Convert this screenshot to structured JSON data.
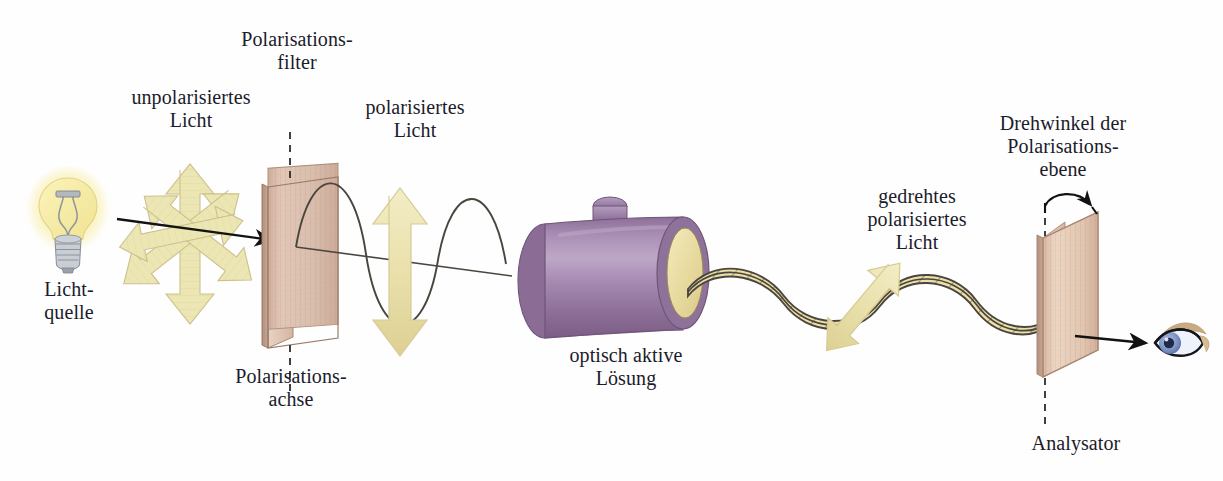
{
  "figure": {
    "language": "de",
    "background_color": "#fefefe",
    "text_color": "#1b1b2b"
  },
  "labels": {
    "light_source": "Licht-\nquelle",
    "unpolarized_light": "unpolarisiertes\nLicht",
    "polarization_filter": "Polarisations-\nfilter",
    "polarization_axis": "Polarisations-\nachse",
    "polarized_light": "polarisiertes\nLicht",
    "optically_active_solution": "optisch aktive\nLösung",
    "rotated_polarized_light": "gedrehtes\npolarisiertes\nLicht",
    "rotation_angle": "Drehwinkel der\nPolarisations-\nebene",
    "analyzer": "Analysator"
  },
  "components": [
    {
      "name": "light-bulb",
      "label": "Licht-\nquelle",
      "color_glass": "#f2e9a8",
      "color_glow": "#f7e98a",
      "color_base": "#9aa0a8"
    },
    {
      "name": "unpolarized-arrow-burst",
      "label": "unpolarisiertes\nLicht",
      "color": "#efe6b4",
      "arrow_count": 4,
      "arrow_angles_deg": [
        0,
        45,
        90,
        135
      ],
      "meaning": "Schwingung in allen Ebenen"
    },
    {
      "name": "polarization-filter-plate",
      "label": "Polarisations-\nfilter",
      "color_face": "#dcc0b0",
      "color_edge": "#c6a391",
      "axis_label": "Polarisations-\nachse",
      "axis_orientation": "vertikal"
    },
    {
      "name": "polarized-wave",
      "label": "polarisiertes\nLicht",
      "color_fill": "#ece1a8",
      "color_stroke": "#4a463f",
      "hatching": "vertikal",
      "amplitude_px": 62,
      "cycles": 2,
      "oscillation_angle_deg": 0
    },
    {
      "name": "polarized-double-arrow",
      "color": "#ece6b4",
      "angle_deg": 0,
      "meaning": "Schwingungsebene senkrecht"
    },
    {
      "name": "sample-tube",
      "label": "optisch aktive\nLösung",
      "color_body": "#9b7ba5",
      "color_body_light": "#b49bbd",
      "color_body_dark": "#7c6086",
      "color_end_face": "#ece0a6",
      "has_stopper": true
    },
    {
      "name": "rotated-wave",
      "label": "gedrehtes\npolarisiertes\nLicht",
      "color_fill": "#ece1a8",
      "color_stroke": "#4a463f",
      "hatching": "diagonal",
      "amplitude_px": 26,
      "cycles": 3,
      "oscillation_angle_deg": 40
    },
    {
      "name": "rotated-double-arrow",
      "color": "#ece6b4",
      "angle_deg": 40,
      "meaning": "gedrehte Schwingungsebene"
    },
    {
      "name": "analyzer-plate",
      "label": "Analysator",
      "color_face": "#e3c8b4",
      "color_edge": "#cdae99",
      "tilt_deg": 18,
      "rotation_arc_label": "Drehwinkel der\nPolarisations-\nebene"
    },
    {
      "name": "observer-eye",
      "color_iris": "#8fa4d4",
      "color_pupil": "#1d2a4a",
      "color_sclera": "#eef2fb",
      "color_lid": "#c9ab82"
    }
  ],
  "arrows": [
    {
      "name": "beam-arrow-source-to-filter",
      "from": "light-bulb",
      "to": "polarization-filter-plate",
      "style": "solid-black"
    },
    {
      "name": "beam-arrow-analyzer-to-eye",
      "from": "analyzer-plate",
      "to": "observer-eye",
      "style": "solid-black"
    },
    {
      "name": "rotation-angle-arc",
      "from": "polarization-axis-dashed",
      "to": "analyzer-top-edge",
      "style": "curved-black"
    }
  ]
}
